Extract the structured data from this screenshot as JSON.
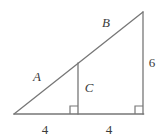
{
  "figure": {
    "background_color": "#ffffff",
    "stroke_color": "#777777",
    "label_color": "#3b3b3b",
    "canvas": {
      "width": 162,
      "height": 140
    },
    "vertices": {
      "bottom_left": {
        "x": 14,
        "y": 114
      },
      "bottom_right": {
        "x": 143,
        "y": 114
      },
      "apex": {
        "x": 143,
        "y": 12
      },
      "altitude_foot": {
        "x": 78,
        "y": 114
      },
      "altitude_top": {
        "x": 78,
        "y": 63
      }
    },
    "segments": [
      {
        "name": "hypotenuse",
        "from": "bottom_left",
        "to": "apex"
      },
      {
        "name": "base",
        "from": "bottom_left",
        "to": "bottom_right"
      },
      {
        "name": "right-side",
        "from": "bottom_right",
        "to": "apex"
      },
      {
        "name": "altitude",
        "from": "altitude_foot",
        "to": "altitude_top"
      }
    ],
    "right_angle_markers": [
      {
        "name": "right-angle-at-altitude-foot",
        "x": 78,
        "y": 114,
        "size": 8
      },
      {
        "name": "right-angle-at-bottom-right",
        "x": 143,
        "y": 114,
        "size": 8
      }
    ],
    "labels": [
      {
        "id": "label-a",
        "text": "A",
        "style": "italic",
        "x": 37,
        "y": 76
      },
      {
        "id": "label-b",
        "text": "B",
        "style": "italic",
        "x": 106,
        "y": 22
      },
      {
        "id": "label-c",
        "text": "C",
        "style": "italic",
        "x": 89,
        "y": 87
      },
      {
        "id": "side-6",
        "text": "6",
        "style": "normal",
        "x": 152,
        "y": 62
      },
      {
        "id": "base-left-4",
        "text": "4",
        "style": "normal",
        "x": 45,
        "y": 129
      },
      {
        "id": "base-right-4",
        "text": "4",
        "style": "normal",
        "x": 109,
        "y": 129
      }
    ]
  }
}
